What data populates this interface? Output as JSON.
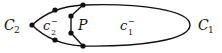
{
  "diagram": {
    "labels": {
      "c2_main": "C",
      "c2_sub": "2",
      "c2minus_main": "c",
      "c2minus_sup": "−",
      "c2minus_sub": "2",
      "p": "P",
      "c1minus_main": "c",
      "c1minus_sup": "−",
      "c1minus_sub": "1",
      "c1_main": "C",
      "c1_sub": "1"
    },
    "colors": {
      "stroke": "#111111",
      "background": "#ffffff"
    }
  }
}
